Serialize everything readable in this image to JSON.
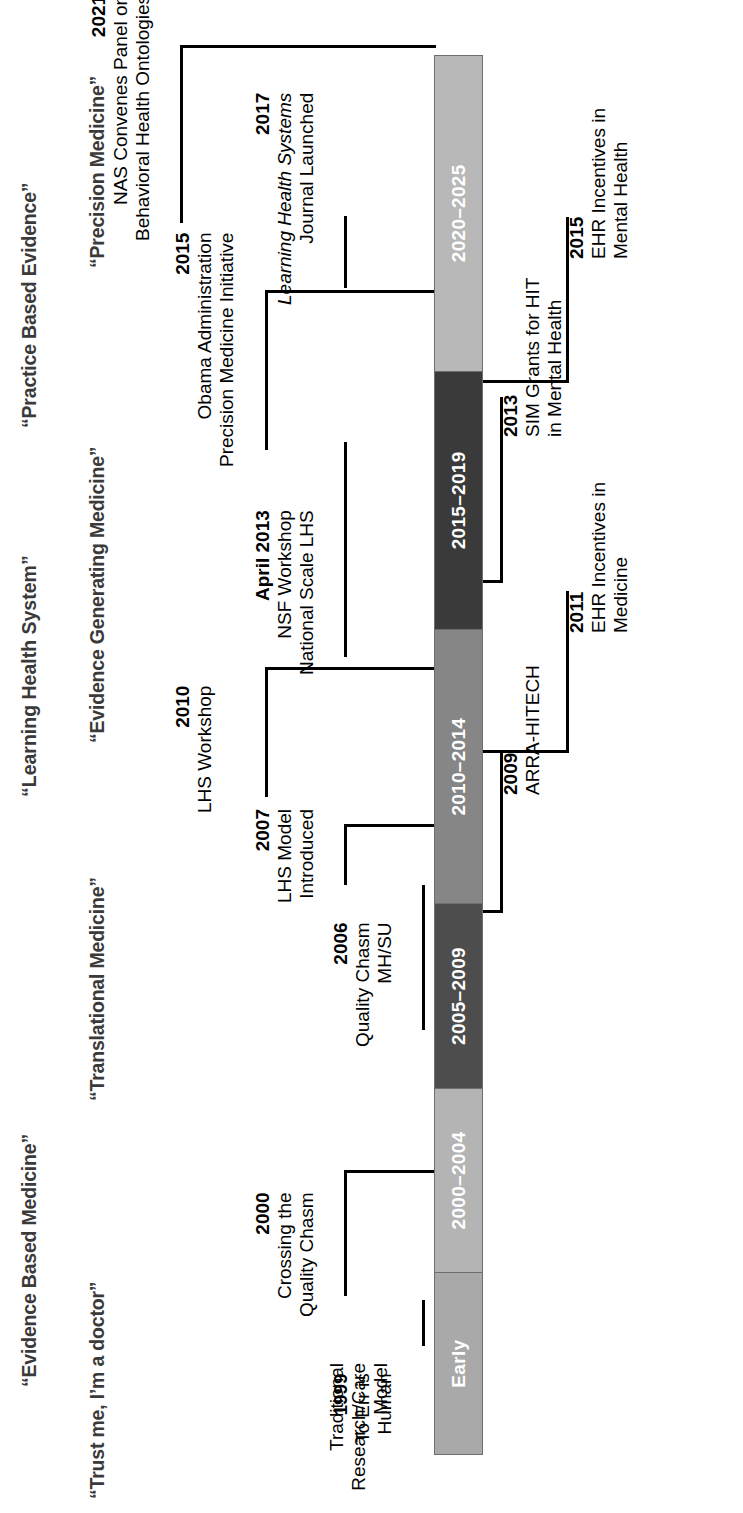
{
  "figure": {
    "title": "“Learning Health System”",
    "paradigm_labels_row1": [
      "“Evidence Based Medicine”",
      "“Practice Based Evidence”"
    ],
    "paradigm_labels_row2": [
      "“Trust me, I’m a doctor”",
      "“Translational Medicine”",
      "“Evidence Generating Medicine”",
      "“Precision Medicine”"
    ],
    "traditional_model_caption": "Traditional\nResearch/Care\nModel"
  },
  "timeline": {
    "segments": [
      {
        "label": "Early",
        "color": "#a9a9a9",
        "text_color": "#ffffff",
        "width_pct": 13.0
      },
      {
        "label": "2000–2004",
        "color": "#b4b4b4",
        "text_color": "#ffffff",
        "width_pct": 13.2
      },
      {
        "label": "2005–2009",
        "color": "#4d4d4d",
        "text_color": "#ffffff",
        "width_pct": 13.2
      },
      {
        "label": "2010–2014",
        "color": "#868686",
        "text_color": "#ffffff",
        "width_pct": 19.6
      },
      {
        "label": "2015–2019",
        "color": "#3a3a3a",
        "text_color": "#ffffff",
        "width_pct": 18.5
      },
      {
        "label": "2020–2025",
        "color": "#b8b8b8",
        "text_color": "#ffffff",
        "width_pct": 22.5
      }
    ],
    "border_color": "#6e6e6e"
  },
  "events_above": [
    {
      "year": "1999",
      "lines": [
        "To Err is",
        "Human"
      ],
      "italic_lines": []
    },
    {
      "year": "2000",
      "lines": [
        "Crossing the",
        "Quality Chasm"
      ],
      "italic_lines": []
    },
    {
      "year": "2006",
      "lines": [
        "Quality Chasm",
        "MH/SU"
      ],
      "italic_lines": []
    },
    {
      "year": "2007",
      "lines": [
        "LHS Model",
        "Introduced"
      ],
      "italic_lines": []
    },
    {
      "year": "2010",
      "lines": [
        "LHS Workshop"
      ],
      "italic_lines": []
    },
    {
      "year": "April 2013",
      "lines": [
        "NSF Workshop",
        "National Scale LHS"
      ],
      "italic_lines": []
    },
    {
      "year": "2015",
      "lines": [
        "Obama Administration",
        "Precision Medicine Initiative"
      ],
      "italic_lines": []
    },
    {
      "year": "2017",
      "lines": [
        "Learning Health Systems",
        "Journal Launched"
      ],
      "italic_lines": [
        0
      ]
    },
    {
      "year": "2021",
      "lines": [
        "NAS Convenes Panel on",
        "Behavioral Health Ontologies"
      ],
      "italic_lines": []
    }
  ],
  "events_below": [
    {
      "year": "2009",
      "lines": [
        "ARRA-HITECH"
      ],
      "italic_lines": []
    },
    {
      "year": "2011",
      "lines": [
        "EHR Incentives in",
        "Medicine"
      ],
      "italic_lines": []
    },
    {
      "year": "2013",
      "lines": [
        "SIM Grants for HIT",
        "in Mental Health"
      ],
      "italic_lines": []
    },
    {
      "year": "2015",
      "lines": [
        "EHR Incentives in",
        "Mental Health"
      ],
      "italic_lines": []
    }
  ]
}
